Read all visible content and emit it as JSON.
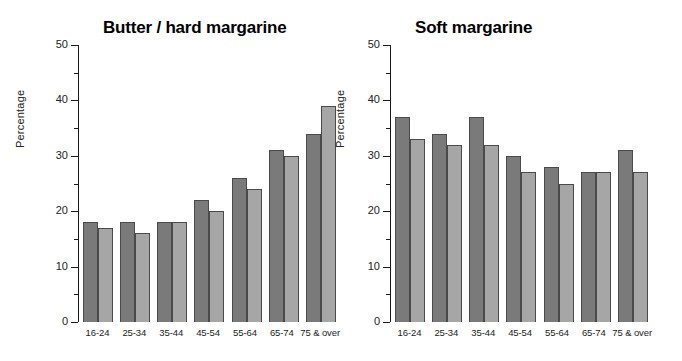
{
  "chart_data": [
    {
      "type": "bar",
      "title": "Butter / hard margarine",
      "xlabel": "",
      "ylabel": "Percentage",
      "ylim": [
        0,
        50
      ],
      "yticks": [
        0,
        10,
        20,
        30,
        40,
        50
      ],
      "ytick_labels": [
        "0",
        "10",
        "20",
        "30",
        "40",
        "50"
      ],
      "minor_yticks": [
        5,
        15,
        25,
        35,
        45
      ],
      "grid": false,
      "legend": "none",
      "categories": [
        "16-24",
        "25-34",
        "35-44",
        "45-54",
        "55-64",
        "65-74",
        "75 & over"
      ],
      "series": [
        {
          "name": "series-1",
          "color": "#7a7a7a",
          "values": [
            18,
            18,
            18,
            22,
            26,
            31,
            34
          ]
        },
        {
          "name": "series-2",
          "color": "#a6a6a6",
          "values": [
            17,
            16,
            18,
            20,
            24,
            30,
            39
          ]
        }
      ]
    },
    {
      "type": "bar",
      "title": "Soft margarine",
      "xlabel": "",
      "ylabel": "Percentage",
      "ylim": [
        0,
        50
      ],
      "yticks": [
        0,
        10,
        20,
        30,
        40,
        50
      ],
      "ytick_labels": [
        "0",
        "10",
        "20",
        "30",
        "40",
        "50"
      ],
      "minor_yticks": [
        5,
        15,
        25,
        35,
        45
      ],
      "grid": false,
      "legend": "none",
      "categories": [
        "16-24",
        "25-34",
        "35-44",
        "45-54",
        "55-64",
        "65-74",
        "75 & over"
      ],
      "series": [
        {
          "name": "series-1",
          "color": "#7a7a7a",
          "values": [
            37,
            34,
            37,
            30,
            28,
            27,
            31
          ]
        },
        {
          "name": "series-2",
          "color": "#a6a6a6",
          "values": [
            33,
            32,
            32,
            27,
            25,
            27,
            27
          ]
        }
      ]
    }
  ]
}
